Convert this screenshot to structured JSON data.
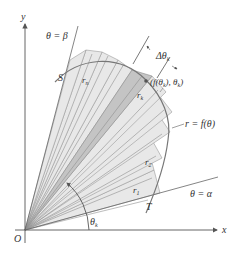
{
  "diagram": {
    "origin": {
      "x": 25,
      "y": 230
    },
    "axes": {
      "x_label": "x",
      "y_label": "y",
      "origin_label": "O"
    },
    "rays": {
      "beta_label": "θ = β",
      "alpha_label": "θ = α",
      "beta_angle_deg": 75.4,
      "alpha_angle_deg": 15.4
    },
    "curve": {
      "label": "r = f(θ)",
      "start_label": "T",
      "end_label": "S"
    },
    "sectors": {
      "first_label": "r",
      "first_sub": "1",
      "second_label": "r",
      "second_sub": "2",
      "kth_label": "r",
      "kth_sub": "k",
      "last_label": "r",
      "last_sub": "n",
      "delta_label": "Δθ",
      "delta_sub": "k",
      "point_label_pre": "(f(θ",
      "point_label_sub1": "k",
      "point_label_mid": "), θ",
      "point_label_sub2": "k",
      "point_label_post": ")",
      "angle_label": "θ",
      "angle_sub": "k"
    },
    "colors": {
      "background": "#ffffff",
      "sector_light": "#e8e8e8",
      "sector_k": "#c4c4c4",
      "line": "#666666",
      "curve": "#777777",
      "text": "#333333"
    }
  }
}
